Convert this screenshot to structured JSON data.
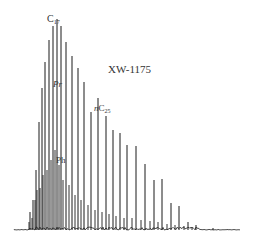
{
  "chart_data": {
    "type": "line",
    "title": "XW-1175",
    "xlabel": "",
    "ylabel": "",
    "grid": false,
    "legend": null,
    "annotations": [
      {
        "text": "C",
        "sub": "17",
        "x": 47,
        "y": 14,
        "italic": false,
        "name": "c17"
      },
      {
        "text": "Pr",
        "sub": "",
        "x": 53,
        "y": 80,
        "italic": true,
        "name": "pristane"
      },
      {
        "text": "n",
        "textMain": "C",
        "sub": "25",
        "x": 94,
        "y": 104,
        "italic": false,
        "name": "nc25"
      },
      {
        "text": "Ph",
        "sub": "",
        "x": 56,
        "y": 156,
        "italic": false,
        "name": "phytane"
      }
    ],
    "baseline": {
      "y": 230,
      "x_start": 14,
      "x_end": 240
    },
    "peaks": [
      {
        "x": 30,
        "top": 212
      },
      {
        "x": 33,
        "top": 200
      },
      {
        "x": 36,
        "top": 170
      },
      {
        "x": 39,
        "top": 122
      },
      {
        "x": 42,
        "top": 88
      },
      {
        "x": 45,
        "top": 62
      },
      {
        "x": 49,
        "top": 40
      },
      {
        "x": 53,
        "top": 26
      },
      {
        "x": 57,
        "top": 19
      },
      {
        "x": 61,
        "top": 26
      },
      {
        "x": 66,
        "top": 42
      },
      {
        "x": 72,
        "top": 56
      },
      {
        "x": 78,
        "top": 68
      },
      {
        "x": 84,
        "top": 82
      },
      {
        "x": 91,
        "top": 112
      },
      {
        "x": 98,
        "top": 98
      },
      {
        "x": 106,
        "top": 116
      },
      {
        "x": 113,
        "top": 130
      },
      {
        "x": 120,
        "top": 133
      },
      {
        "x": 127,
        "top": 145
      },
      {
        "x": 136,
        "top": 146
      },
      {
        "x": 145,
        "top": 164
      },
      {
        "x": 154,
        "top": 180
      },
      {
        "x": 162,
        "top": 179
      },
      {
        "x": 171,
        "top": 203
      },
      {
        "x": 179,
        "top": 206
      },
      {
        "x": 188,
        "top": 222
      },
      {
        "x": 196,
        "top": 225
      },
      {
        "x": 213,
        "top": 228
      }
    ],
    "minor_peaks": [
      {
        "x": 29,
        "top": 222
      },
      {
        "x": 32,
        "top": 218
      },
      {
        "x": 35,
        "top": 200
      },
      {
        "x": 37,
        "top": 190
      },
      {
        "x": 40,
        "top": 188
      },
      {
        "x": 43,
        "top": 175
      },
      {
        "x": 47,
        "top": 170
      },
      {
        "x": 51,
        "top": 160
      },
      {
        "x": 55,
        "top": 150
      },
      {
        "x": 59,
        "top": 165
      },
      {
        "x": 63,
        "top": 180
      },
      {
        "x": 69,
        "top": 185
      },
      {
        "x": 75,
        "top": 195
      },
      {
        "x": 81,
        "top": 200
      },
      {
        "x": 88,
        "top": 205
      },
      {
        "x": 95,
        "top": 210
      },
      {
        "x": 102,
        "top": 212
      },
      {
        "x": 109,
        "top": 214
      },
      {
        "x": 116,
        "top": 216
      },
      {
        "x": 124,
        "top": 218
      },
      {
        "x": 132,
        "top": 218
      },
      {
        "x": 141,
        "top": 220
      },
      {
        "x": 150,
        "top": 221
      },
      {
        "x": 158,
        "top": 222
      },
      {
        "x": 167,
        "top": 224
      },
      {
        "x": 175,
        "top": 225
      },
      {
        "x": 184,
        "top": 226
      },
      {
        "x": 192,
        "top": 227
      }
    ]
  }
}
